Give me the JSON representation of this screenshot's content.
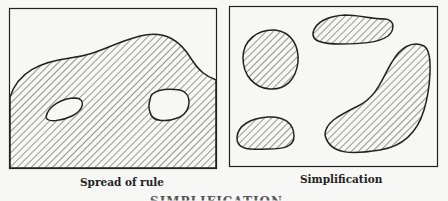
{
  "panels": [
    {
      "id": "left",
      "caption": "Spread of rule"
    },
    {
      "id": "right",
      "caption": "Simplification"
    }
  ],
  "cut_title": "SIMPLIFICATION",
  "colors": {
    "ink": "#222222",
    "paper": "#f7f7f5"
  }
}
